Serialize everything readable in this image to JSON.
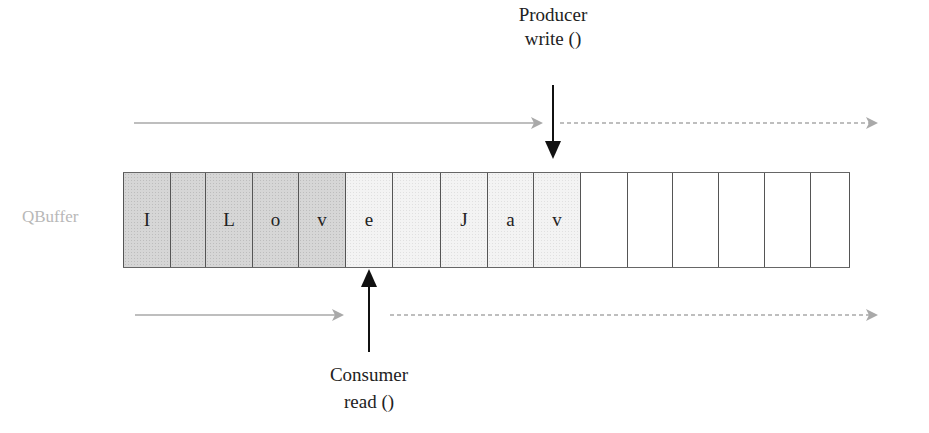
{
  "diagram": {
    "buffer_label": "QBuffer",
    "producer": {
      "title": "Producer",
      "method": "write ()"
    },
    "consumer": {
      "title": "Consumer",
      "method": "read ()"
    },
    "cells": [
      {
        "char": "I",
        "state": "dark",
        "width": 47
      },
      {
        "char": "",
        "state": "dark",
        "width": 35
      },
      {
        "char": "L",
        "state": "dark",
        "width": 47
      },
      {
        "char": "o",
        "state": "dark",
        "width": 46
      },
      {
        "char": "v",
        "state": "dark",
        "width": 47
      },
      {
        "char": "e",
        "state": "light",
        "width": 47
      },
      {
        "char": "",
        "state": "light",
        "width": 48
      },
      {
        "char": "J",
        "state": "light",
        "width": 47
      },
      {
        "char": "a",
        "state": "light",
        "width": 46
      },
      {
        "char": "v",
        "state": "light",
        "width": 47
      },
      {
        "char": "",
        "state": "empty",
        "width": 47
      },
      {
        "char": "",
        "state": "empty",
        "width": 45
      },
      {
        "char": "",
        "state": "empty",
        "width": 46
      },
      {
        "char": "",
        "state": "empty",
        "width": 46
      },
      {
        "char": "",
        "state": "empty",
        "width": 46
      },
      {
        "char": "",
        "state": "empty",
        "width": 40
      }
    ],
    "colors": {
      "read_cells": "#d6d6d6",
      "unread_cells": "#f3f3f3",
      "progress_arrow": "#a9a9a9",
      "pointer_arrow": "#111111",
      "buffer_label": "#b8b8b8"
    }
  }
}
